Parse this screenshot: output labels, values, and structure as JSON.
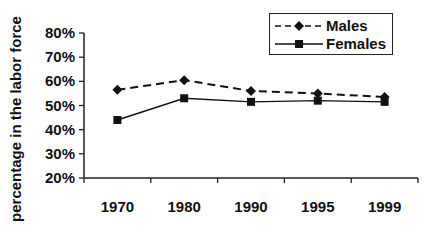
{
  "chart_data": {
    "type": "line",
    "title": "",
    "xlabel": "",
    "ylabel": "percentage in the labor force",
    "categories": [
      "1970",
      "1980",
      "1990",
      "1995",
      "1999"
    ],
    "series": [
      {
        "name": "Males",
        "values": [
          56.5,
          60.5,
          56,
          55,
          53.5
        ],
        "line_style": "dashed",
        "marker": "diamond",
        "color": "#111111"
      },
      {
        "name": "Females",
        "values": [
          44,
          53,
          51.5,
          52,
          51.5
        ],
        "line_style": "solid",
        "marker": "square",
        "color": "#111111"
      }
    ],
    "ylim": [
      20,
      80
    ],
    "yticks": [
      "20%",
      "30%",
      "40%",
      "50%",
      "60%",
      "70%",
      "80%"
    ],
    "grid": false,
    "legend_position": "top-right"
  }
}
